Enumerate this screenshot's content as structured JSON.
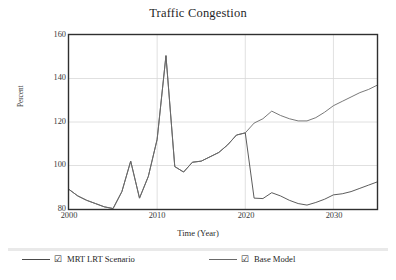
{
  "chart_data": {
    "type": "line",
    "title": "Traffic Congestion",
    "xlabel": "Time (Year)",
    "ylabel": "Percent",
    "xlim": [
      2000,
      2035
    ],
    "ylim": [
      80,
      160
    ],
    "xticks": [
      2000,
      2010,
      2020,
      2030
    ],
    "yticks": [
      80,
      100,
      120,
      140,
      160
    ],
    "grid": true,
    "legend_position": "bottom",
    "series": [
      {
        "name": "MRT LRT Scenario",
        "color": "#4a4a4a",
        "checked": true,
        "x": [
          2000,
          2001,
          2002,
          2003,
          2004,
          2005,
          2006,
          2007,
          2008,
          2009,
          2010,
          2011,
          2012,
          2013,
          2014,
          2015,
          2016,
          2017,
          2018,
          2019,
          2020,
          2021,
          2022,
          2023,
          2024,
          2025,
          2026,
          2027,
          2028,
          2029,
          2030,
          2031,
          2032,
          2033,
          2034,
          2035
        ],
        "values": [
          89,
          86,
          84,
          82.5,
          81,
          80.2,
          88,
          102,
          85,
          95,
          112,
          150.5,
          99.5,
          97,
          101.5,
          102,
          104,
          106,
          109.5,
          114,
          115,
          85,
          84.8,
          87.5,
          86,
          84,
          82.5,
          81.8,
          83,
          84.5,
          86.5,
          87,
          88,
          89.5,
          91,
          92.5
        ]
      },
      {
        "name": "Base Model",
        "color": "#6a6a6a",
        "checked": true,
        "x": [
          2000,
          2001,
          2002,
          2003,
          2004,
          2005,
          2006,
          2007,
          2008,
          2009,
          2010,
          2011,
          2012,
          2013,
          2014,
          2015,
          2016,
          2017,
          2018,
          2019,
          2020,
          2021,
          2022,
          2023,
          2024,
          2025,
          2026,
          2027,
          2028,
          2029,
          2030,
          2031,
          2032,
          2033,
          2034,
          2035
        ],
        "values": [
          89,
          86,
          84,
          82.5,
          81,
          80.2,
          88,
          102,
          85,
          95,
          112,
          150.5,
          99.5,
          97,
          101.5,
          102,
          104,
          106,
          109.5,
          114,
          115,
          119.5,
          121.5,
          125,
          123,
          121.5,
          120.5,
          120.5,
          122,
          124.5,
          127.5,
          129.5,
          131.5,
          133.5,
          135,
          137
        ]
      }
    ]
  },
  "axis": {
    "yticks": [
      "160",
      "140",
      "120",
      "100",
      "80"
    ],
    "xticks": [
      "2000",
      "2010",
      "2020",
      "2030"
    ],
    "ylabel": "Percent",
    "xlabel": "Time (Year)"
  },
  "title": "Traffic Congestion",
  "legend": {
    "items": [
      {
        "label": "MRT LRT Scenario",
        "check": "☑"
      },
      {
        "label": "Base Model",
        "check": "☑"
      }
    ]
  }
}
